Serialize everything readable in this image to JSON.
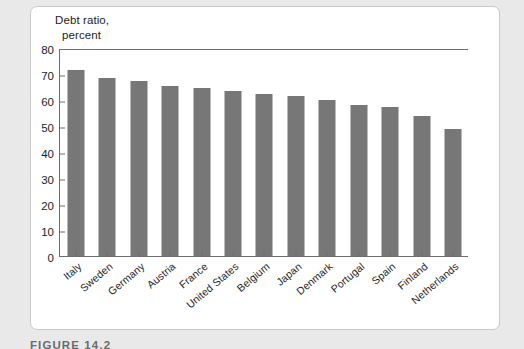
{
  "figure": {
    "caption": "FIGURE 14.2"
  },
  "chart_data": {
    "type": "bar",
    "title": "",
    "axis_title_line1": "Debt ratio,",
    "axis_title_line2": "percent",
    "xlabel": "",
    "ylabel": "Debt ratio, percent",
    "ylim": [
      0,
      80
    ],
    "yticks": [
      0,
      10,
      20,
      30,
      40,
      50,
      60,
      70,
      80
    ],
    "ytick_labels": [
      "0",
      "10",
      "20",
      "30",
      "40",
      "50",
      "60",
      "70",
      "80"
    ],
    "grid": false,
    "legend": "none",
    "bar_color": "#777777",
    "axis_color": "#6e6e6e",
    "categories": [
      "Italy",
      "Sweden",
      "Germany",
      "Austria",
      "France",
      "United States",
      "Belgium",
      "Japan",
      "Denmark",
      "Portugal",
      "Spain",
      "Finland",
      "Netherlands"
    ],
    "values": [
      71.5,
      68.5,
      67.5,
      65.5,
      64.5,
      63.5,
      62.5,
      61.5,
      60,
      58,
      57.5,
      54,
      49
    ]
  }
}
